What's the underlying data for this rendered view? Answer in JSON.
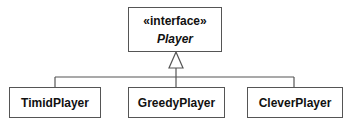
{
  "diagram": {
    "type": "uml-class-diagram",
    "interface": {
      "stereotype": "«interface»",
      "name": "Player"
    },
    "implementations": [
      {
        "name": "TimidPlayer"
      },
      {
        "name": "GreedyPlayer"
      },
      {
        "name": "CleverPlayer"
      }
    ],
    "relationship": "realization",
    "colors": {
      "line": "#555555",
      "text": "#111111",
      "background": "#ffffff"
    }
  }
}
